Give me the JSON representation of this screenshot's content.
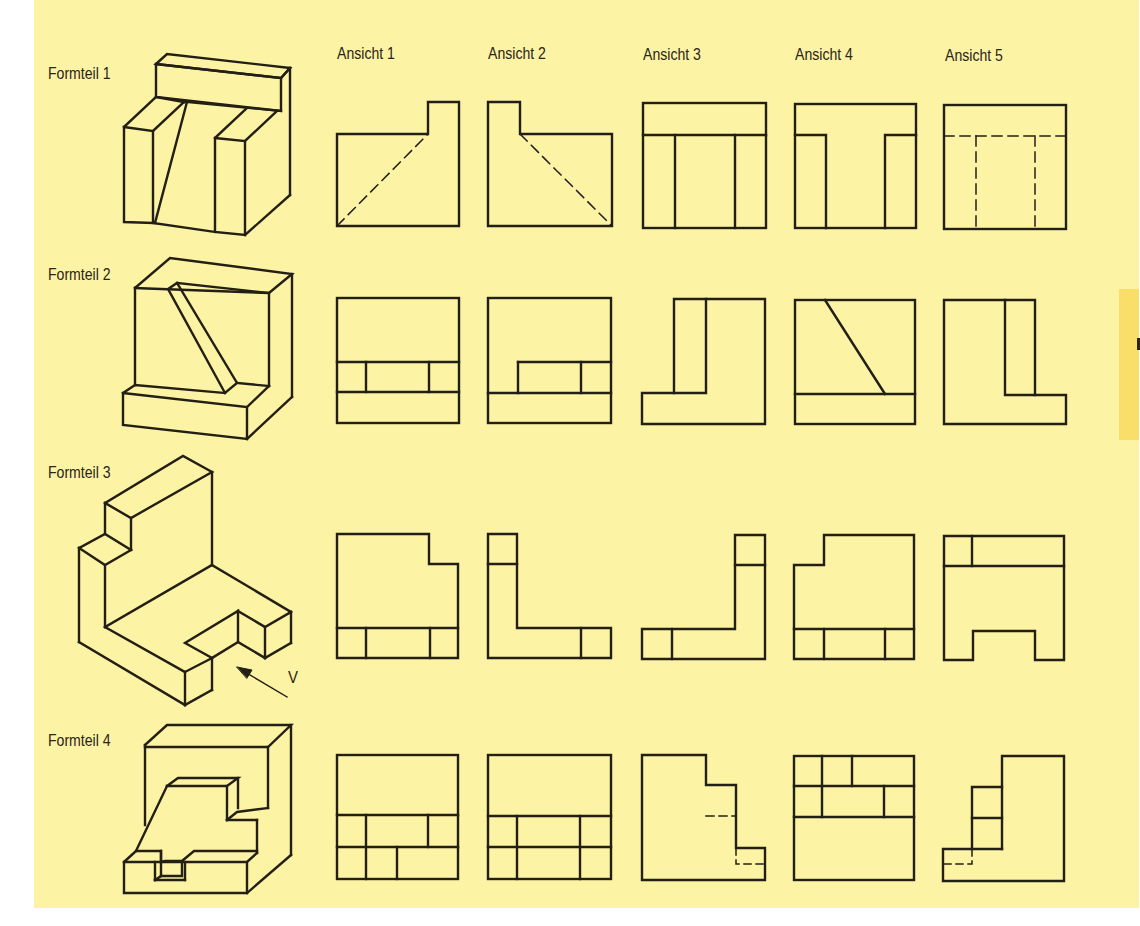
{
  "sheet": {
    "background_color": "#fdf3a4",
    "tab_color": "#f9df6a",
    "line_color": "#231f14"
  },
  "columns": [
    {
      "label": "Ansicht 1"
    },
    {
      "label": "Ansicht 2"
    },
    {
      "label": "Ansicht 3"
    },
    {
      "label": "Ansicht 4"
    },
    {
      "label": "Ansicht 5"
    }
  ],
  "rows": [
    {
      "label": "Formteil 1"
    },
    {
      "label": "Formteil 2"
    },
    {
      "label": "Formteil 3",
      "view_arrow_label": "V"
    },
    {
      "label": "Formteil 4"
    }
  ]
}
